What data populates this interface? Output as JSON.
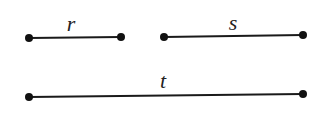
{
  "diagram": {
    "segments": [
      {
        "id": "r",
        "label": "r",
        "x1": 29,
        "y1": 38,
        "x2": 121,
        "y2": 37,
        "label_x": 71,
        "label_y": 31
      },
      {
        "id": "s",
        "label": "s",
        "x1": 164,
        "y1": 37,
        "x2": 303,
        "y2": 35,
        "label_x": 233,
        "label_y": 30
      },
      {
        "id": "t",
        "label": "t",
        "x1": 29,
        "y1": 97,
        "x2": 303,
        "y2": 94,
        "label_x": 163,
        "label_y": 88
      }
    ],
    "colors": {
      "line": "#1a1a1a",
      "endpoint": "#111111",
      "background": "#ffffff"
    }
  }
}
